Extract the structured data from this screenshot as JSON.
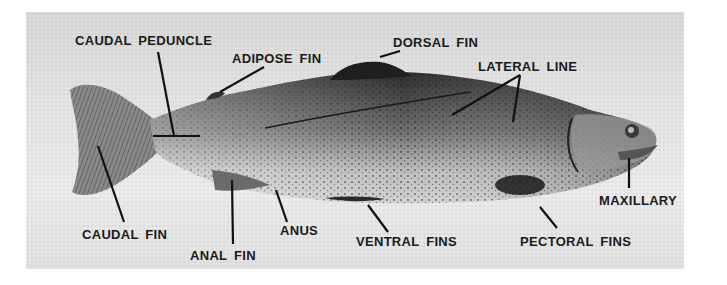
{
  "figure": {
    "labels": {
      "caudal_peduncle": "CAUDAL PEDUNCLE",
      "adipose_fin": "ADIPOSE FIN",
      "dorsal_fin": "DORSAL FIN",
      "lateral_line": "LATERAL LINE",
      "maxillary": "MAXILLARY",
      "caudal_fin": "CAUDAL FIN",
      "anal_fin": "ANAL FIN",
      "anus": "ANUS",
      "ventral_fins": "VENTRAL FINS",
      "pectoral_fins": "PECTORAL FINS"
    },
    "colors": {
      "background": "#e4e4e4",
      "fish_dark": "#2a2a2a",
      "fish_light": "#bdbdbd",
      "text": "#1a1a1a"
    }
  }
}
